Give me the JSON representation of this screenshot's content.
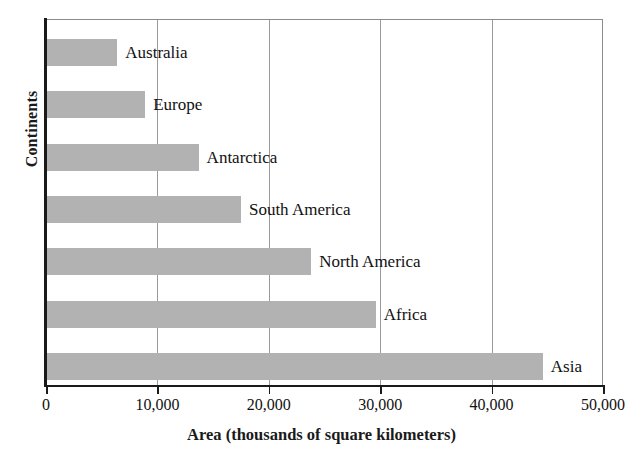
{
  "chart_data": {
    "type": "bar",
    "orientation": "horizontal",
    "title": "",
    "xlabel": "Area (thousands of square kilometers)",
    "ylabel": "Continents",
    "categories": [
      "Australia",
      "Europe",
      "Antarctica",
      "South America",
      "North America",
      "Africa",
      "Asia"
    ],
    "values": [
      6400,
      8900,
      13700,
      17500,
      23800,
      29600,
      44600
    ],
    "xlim": [
      0,
      50000
    ],
    "xticks": [
      0,
      10000,
      20000,
      30000,
      40000,
      50000
    ],
    "xtick_labels": [
      "0",
      "10,000",
      "20,000",
      "30,000",
      "40,000",
      "50,000"
    ],
    "grid": "vertical",
    "legend": "none",
    "bar_color": "#b2b2b2",
    "axis_color": "#1a1a1a",
    "grid_color": "#9a9a9a",
    "bars": [
      {
        "label": "Australia",
        "value": 6400
      },
      {
        "label": "Europe",
        "value": 8900
      },
      {
        "label": "Antarctica",
        "value": 13700
      },
      {
        "label": "South America",
        "value": 17500
      },
      {
        "label": "North America",
        "value": 23800
      },
      {
        "label": "Africa",
        "value": 29600
      },
      {
        "label": "Asia",
        "value": 44600
      }
    ]
  }
}
